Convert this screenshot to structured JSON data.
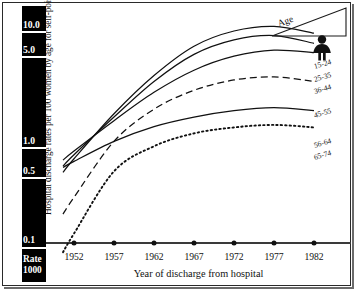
{
  "chart_data": {
    "type": "line",
    "title": "",
    "xlabel": "Year of discharge from hospital",
    "ylabel": "Hospital discharge rates per 100 women by age for self-poisoning",
    "yscale": "log",
    "ytick_labels": [
      "10.0",
      "5.0",
      "1.0",
      "0.5",
      "0.1"
    ],
    "ytick_values": [
      10.0,
      5.0,
      1.0,
      0.5,
      0.1
    ],
    "rate_note_line1": "Rate",
    "rate_note_line2": "1000",
    "x": [
      1952,
      1957,
      1962,
      1967,
      1972,
      1977,
      1982
    ],
    "xtick_labels": [
      "1952",
      "1957",
      "1962",
      "1967",
      "1972",
      "1977",
      "1982"
    ],
    "xlim": [
      1949,
      1984
    ],
    "grid": false,
    "legend_position": "right-of-axes",
    "legend_title": "Age",
    "legend_icon": "female-figure-icon",
    "series": [
      {
        "name": "15-24",
        "style": "solid",
        "values": [
          0.55,
          1.45,
          3.3,
          6.2,
          8.6,
          9.5,
          8.2
        ]
      },
      {
        "name": "25-35",
        "style": "solid",
        "values": [
          0.6,
          1.35,
          2.9,
          5.2,
          7.1,
          7.8,
          6.6
        ]
      },
      {
        "name": "36-44",
        "style": "solid",
        "values": [
          0.65,
          1.25,
          2.3,
          3.7,
          5.0,
          5.7,
          5.4
        ]
      },
      {
        "name": "45-55",
        "style": "dashed",
        "values": [
          0.24,
          0.8,
          1.6,
          2.4,
          3.0,
          3.2,
          2.9
        ]
      },
      {
        "name": "56-64",
        "style": "solid",
        "values": [
          0.52,
          0.8,
          1.1,
          1.35,
          1.55,
          1.65,
          1.55
        ]
      },
      {
        "name": "65-74",
        "style": "dotted",
        "values": [
          0.11,
          0.42,
          0.72,
          0.95,
          1.08,
          1.14,
          1.08
        ]
      }
    ]
  },
  "axis": {
    "y_title": "Hospital discharge rates per 100 women by age for self-poisoning",
    "x_title": "Year of discharge from hospital"
  },
  "legend": {
    "title": "Age",
    "icon_name": "female-figure-icon"
  }
}
